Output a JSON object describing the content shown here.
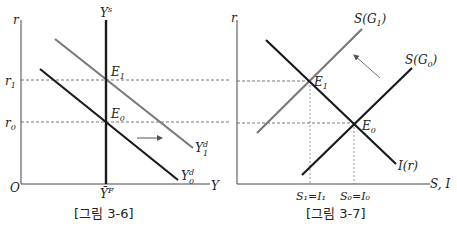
{
  "figures": [
    {
      "caption": "[그림 3-6]",
      "axes": {
        "y_label": "r",
        "x_label": "Y",
        "origin_label": "O"
      },
      "y_ticks": [
        {
          "base": "r",
          "sub": "1"
        },
        {
          "base": "r",
          "sub": "0"
        }
      ],
      "x_ticks": [
        {
          "base": "Ȳ",
          "sup": "F"
        }
      ],
      "curves": [
        {
          "name": "Y^s",
          "base": "Y",
          "sup": "s",
          "style": "vertical",
          "color": "#1a1a1a"
        },
        {
          "name": "Y_0^d",
          "base": "Y",
          "sub": "0",
          "sup": "d",
          "color": "#1a1a1a"
        },
        {
          "name": "Y_1^d",
          "base": "Y",
          "sub": "1",
          "sup": "d",
          "color": "#7a7a7a"
        }
      ],
      "points": [
        {
          "base": "E",
          "sub": "1"
        },
        {
          "base": "E",
          "sub": "0"
        }
      ],
      "shift_arrow": "right"
    },
    {
      "caption": "[그림 3-7]",
      "axes": {
        "y_label": "r",
        "x_label": "S, I"
      },
      "x_ticks": [
        {
          "text": "S₁=I₁"
        },
        {
          "text": "S₀=I₀"
        }
      ],
      "curves": [
        {
          "name": "S(G_1)",
          "text": "S(G",
          "sub": "1",
          "close": ")",
          "color": "#7a7a7a"
        },
        {
          "name": "S(G_0)",
          "text": "S(G",
          "sub": "0",
          "close": ")",
          "color": "#1a1a1a"
        },
        {
          "name": "I(r)",
          "text": "I(r)",
          "color": "#1a1a1a"
        }
      ],
      "points": [
        {
          "base": "E",
          "sub": "1"
        },
        {
          "base": "E",
          "sub": "0"
        }
      ],
      "shift_arrow": "up-left"
    }
  ]
}
